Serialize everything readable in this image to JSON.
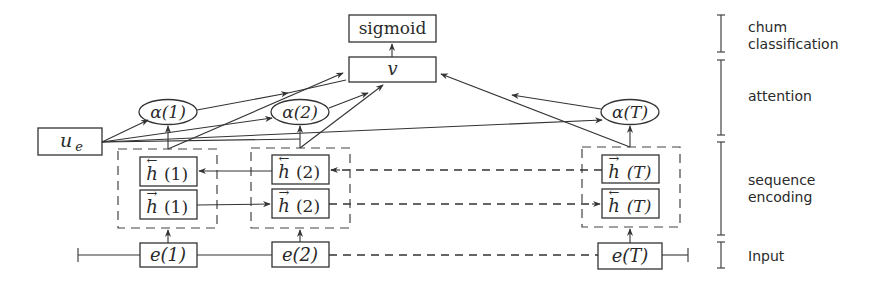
{
  "diagram": {
    "colors": {
      "stroke": "#333333",
      "text": "#2a2a2a",
      "background": "#ffffff",
      "ghost_text": "#eeeeee"
    },
    "output": {
      "sigmoid_label": "sigmoid",
      "v_label": "v"
    },
    "user_embedding": {
      "base": "u",
      "subscript": "e"
    },
    "attention": [
      {
        "label": "α(1)"
      },
      {
        "label": "α(2)"
      },
      {
        "label": "α(T)"
      }
    ],
    "encoding": {
      "columns": [
        {
          "top": {
            "arrow": "←",
            "label": "h",
            "arg": "(1)"
          },
          "bottom": {
            "arrow": "→",
            "label": "h",
            "arg": "(1)"
          }
        },
        {
          "top": {
            "arrow": "←",
            "label": "h",
            "arg": "(2)"
          },
          "bottom": {
            "arrow": "→",
            "label": "h",
            "arg": "(2)"
          }
        },
        {
          "top": {
            "arrow": "→",
            "label": "h",
            "arg": "(T)"
          },
          "bottom": {
            "arrow": "←",
            "label": "h",
            "arg": "(T)"
          }
        }
      ]
    },
    "inputs": [
      {
        "label": "e(1)"
      },
      {
        "label": "e(2)"
      },
      {
        "label": "e(T)"
      }
    ],
    "layers": [
      {
        "line1": "chum",
        "line2": "classification"
      },
      {
        "line1": "attention",
        "line2": ""
      },
      {
        "line1": "sequence",
        "line2": "encoding"
      },
      {
        "line1": "Input",
        "line2": ""
      }
    ]
  }
}
